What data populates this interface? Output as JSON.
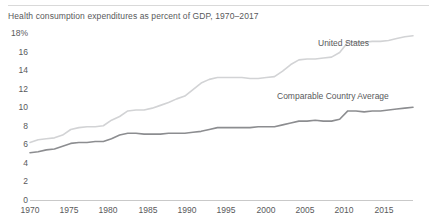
{
  "subtitle": "Health consumption expenditures as percent of GDP, 1970–2017",
  "labels": {
    "united_states": "United States",
    "comparable_country_average": "Comparable Country Average"
  },
  "axis": {
    "y_ticks": [
      "18%",
      "16",
      "14",
      "12",
      "10",
      "8",
      "6",
      "4",
      "2",
      "0"
    ],
    "x_ticks": [
      "1970",
      "1975",
      "1980",
      "1985",
      "1990",
      "1995",
      "2000",
      "2005",
      "2010",
      "2015"
    ]
  },
  "colors": {
    "united_states_line": "#d2d3d5",
    "comparable_line": "#8c8d90",
    "axis": "#c9c9c9",
    "text": "#58595b",
    "background": "#ffffff"
  },
  "chart_data": {
    "type": "line",
    "title": "",
    "subtitle": "Health consumption expenditures as percent of GDP, 1970–2017",
    "xlabel": "",
    "ylabel": "",
    "xlim": [
      1970,
      2017
    ],
    "ylim": [
      0,
      18
    ],
    "grid": false,
    "legend": "inline-annotations",
    "x": [
      1970,
      1971,
      1972,
      1973,
      1974,
      1975,
      1976,
      1977,
      1978,
      1979,
      1980,
      1981,
      1982,
      1983,
      1984,
      1985,
      1986,
      1987,
      1988,
      1989,
      1990,
      1991,
      1992,
      1993,
      1994,
      1995,
      1996,
      1997,
      1998,
      1999,
      2000,
      2001,
      2002,
      2003,
      2004,
      2005,
      2006,
      2007,
      2008,
      2009,
      2010,
      2011,
      2012,
      2013,
      2014,
      2015,
      2016,
      2017
    ],
    "series": [
      {
        "name": "United States",
        "color": "#d2d3d5",
        "values": [
          6.2,
          6.5,
          6.6,
          6.7,
          7.0,
          7.6,
          7.8,
          7.9,
          7.9,
          8.0,
          8.6,
          9.0,
          9.6,
          9.7,
          9.7,
          9.9,
          10.2,
          10.5,
          10.9,
          11.2,
          11.9,
          12.6,
          13.0,
          13.2,
          13.2,
          13.2,
          13.2,
          13.1,
          13.1,
          13.2,
          13.3,
          13.9,
          14.6,
          15.1,
          15.2,
          15.2,
          15.3,
          15.4,
          15.9,
          17.0,
          17.0,
          17.0,
          17.1,
          17.1,
          17.2,
          17.4,
          17.6,
          17.7
        ]
      },
      {
        "name": "Comparable Country Average",
        "color": "#8c8d90",
        "values": [
          5.1,
          5.2,
          5.4,
          5.5,
          5.8,
          6.1,
          6.2,
          6.2,
          6.3,
          6.3,
          6.6,
          7.0,
          7.2,
          7.2,
          7.1,
          7.1,
          7.1,
          7.2,
          7.2,
          7.2,
          7.3,
          7.4,
          7.6,
          7.8,
          7.8,
          7.8,
          7.8,
          7.8,
          7.9,
          7.9,
          7.9,
          8.1,
          8.3,
          8.5,
          8.5,
          8.6,
          8.5,
          8.5,
          8.7,
          9.6,
          9.6,
          9.5,
          9.6,
          9.6,
          9.7,
          9.8,
          9.9,
          10.0
        ]
      }
    ]
  }
}
